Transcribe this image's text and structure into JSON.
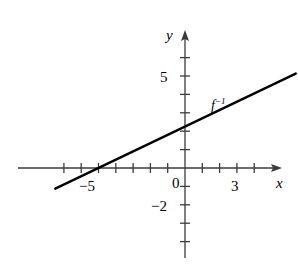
{
  "figure": {
    "kind": "cartesian-line-graph",
    "background": "#ffffff",
    "ink_color": "#000000",
    "axis_color": "#3b3b3b"
  },
  "labels": {
    "x_axis": "x",
    "y_axis": "y",
    "origin": "0",
    "x_tick_3": "3",
    "x_tick_minus5": "−5",
    "y_tick_5": "5",
    "y_tick_minus2": "−2",
    "curve": "f",
    "curve_exponent": "−1"
  },
  "chart_data": {
    "type": "line",
    "title": "",
    "xlabel": "x",
    "ylabel": "y",
    "grid": false,
    "legend": "inline-annotation",
    "xlim": [
      -7.6,
      6.5
    ],
    "ylim": [
      -3.1,
      6.6
    ],
    "x_ticks": [
      -7,
      -6,
      -5,
      -4,
      -3,
      -2,
      -1,
      1,
      2,
      3,
      4
    ],
    "y_ticks": [
      -2,
      -1,
      1,
      2,
      3,
      4,
      5,
      6
    ],
    "x_tick_labels_shown": [
      {
        "value": -5,
        "text": "−5"
      },
      {
        "value": 3,
        "text": "3"
      }
    ],
    "y_tick_labels_shown": [
      {
        "value": 5,
        "text": "5"
      },
      {
        "value": -2,
        "text": "−2"
      },
      {
        "value": 0,
        "text": "0"
      }
    ],
    "series": [
      {
        "name": "f⁻¹",
        "annotation": "f⁻¹",
        "annotation_x": 1.6,
        "annotation_y": 3.9,
        "kind": "straight-line",
        "slope": 0.45,
        "intercept": 2.25,
        "x_intercept": -5,
        "y_intercept": 2.25,
        "x": [
          -7.5,
          6.4
        ],
        "y": [
          -1.13,
          5.13
        ]
      }
    ]
  },
  "geometry": {
    "origin_px": {
      "x": 185,
      "y": 168
    },
    "unit_px": {
      "x": 17.3,
      "y": 18.4
    },
    "x_axis_span_px": {
      "x1": 18,
      "x2": 282
    },
    "y_axis_span_px": {
      "y1": 30,
      "y2": 258
    }
  }
}
